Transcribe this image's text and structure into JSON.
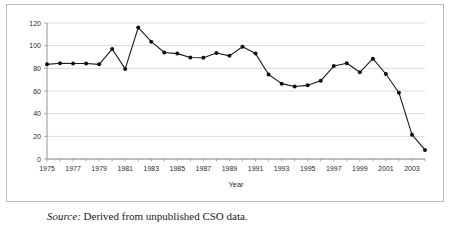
{
  "figure": {
    "source_label": "Source:",
    "source_text": "Derived from unpublished CSO data."
  },
  "chart_data": {
    "type": "line",
    "title": "",
    "xlabel": "Year",
    "ylabel": "",
    "xlim": [
      1975,
      2004
    ],
    "ylim": [
      0,
      120
    ],
    "ytick_values": [
      0,
      20,
      40,
      60,
      80,
      100,
      120
    ],
    "ytick_labels": [
      "0",
      "20",
      "40",
      "60",
      "80",
      "100",
      "120"
    ],
    "xtick_values": [
      1975,
      1977,
      1979,
      1981,
      1983,
      1985,
      1987,
      1989,
      1991,
      1993,
      1995,
      1997,
      1999,
      2001,
      2003
    ],
    "xtick_labels": [
      "1975",
      "1977",
      "1979",
      "1981",
      "1983",
      "1985",
      "1987",
      "1989",
      "1991",
      "1993",
      "1995",
      "1997",
      "1999",
      "2001",
      "2003"
    ],
    "grid": true,
    "legend": "none",
    "marker": "filled-circle",
    "line_color": "#1a1a1a",
    "marker_color": "#101010",
    "grid_color": "#c8c8c8",
    "x": [
      1975,
      1976,
      1977,
      1978,
      1979,
      1980,
      1981,
      1982,
      1983,
      1984,
      1985,
      1986,
      1987,
      1988,
      1989,
      1990,
      1991,
      1992,
      1993,
      1994,
      1995,
      1996,
      1997,
      1998,
      1999,
      2000,
      2001,
      2002,
      2003,
      2004
    ],
    "values": [
      83.5,
      84.5,
      84.3,
      84.3,
      83.5,
      97,
      79.5,
      116,
      103.5,
      94,
      93,
      89.5,
      89.3,
      93.5,
      91,
      99,
      93,
      74.5,
      66.5,
      64,
      65,
      69,
      82,
      84.5,
      76.5,
      88.5,
      75,
      58.5,
      21.5,
      8
    ]
  }
}
